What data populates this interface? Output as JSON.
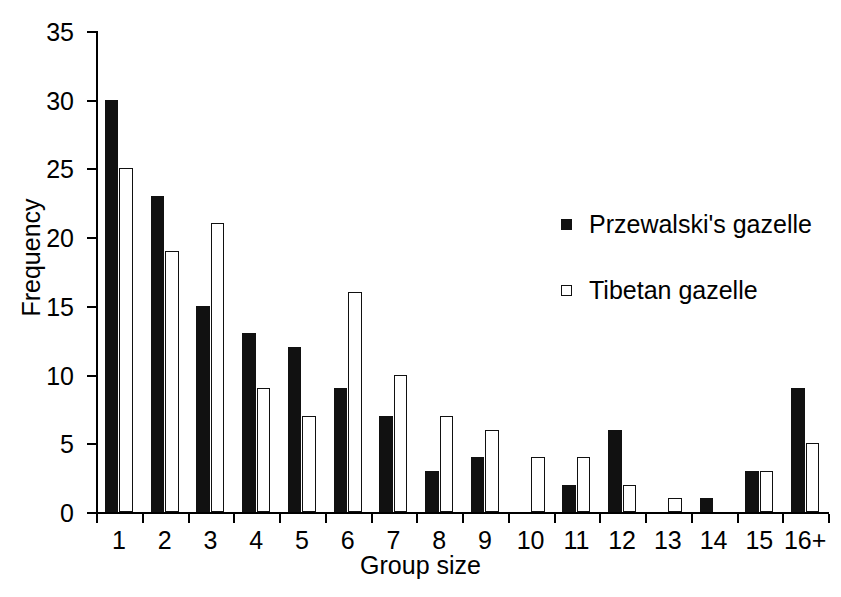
{
  "chart_data": {
    "type": "bar",
    "title": "",
    "xlabel": "Group size",
    "ylabel": "Frequency",
    "categories": [
      "1",
      "2",
      "3",
      "4",
      "5",
      "6",
      "7",
      "8",
      "9",
      "10",
      "11",
      "12",
      "13",
      "14",
      "15",
      "16+"
    ],
    "series": [
      {
        "name": "Przewalski's gazelle",
        "marker": "filled-square",
        "color": "#111111",
        "values": [
          30,
          23,
          15,
          13,
          12,
          9,
          7,
          3,
          4,
          0,
          2,
          6,
          0,
          1,
          3,
          9
        ]
      },
      {
        "name": "Tibetan gazelle",
        "marker": "open-square",
        "color": "#ffffff",
        "values": [
          25,
          19,
          21,
          9,
          7,
          16,
          10,
          7,
          6,
          4,
          4,
          2,
          1,
          0,
          3,
          5
        ]
      }
    ],
    "ylim": [
      0,
      35
    ],
    "yticks": [
      0,
      5,
      10,
      15,
      20,
      25,
      30,
      35
    ],
    "ytick_labels": [
      "0",
      "5",
      "10",
      "15",
      "20",
      "25",
      "30",
      "35"
    ],
    "grid": false,
    "legend_position": "center-right",
    "axis_color": "#000000"
  }
}
